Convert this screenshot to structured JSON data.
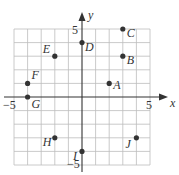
{
  "chart_data": {
    "type": "scatter",
    "title": "",
    "xlabel": "x",
    "ylabel": "y",
    "xlim": [
      -5,
      5
    ],
    "ylim": [
      -5,
      5
    ],
    "grid": true,
    "grid_step": 1,
    "tick_labels": {
      "x": [
        {
          "value": -5,
          "label": "−5"
        },
        {
          "value": 5,
          "label": "5"
        }
      ],
      "y": [
        {
          "value": 5,
          "label": "5"
        },
        {
          "value": -5,
          "label": "−5"
        }
      ]
    },
    "points": [
      {
        "label": "A",
        "x": 2,
        "y": 1,
        "lx": 4,
        "ly": 6
      },
      {
        "label": "B",
        "x": 3,
        "y": 3,
        "lx": 4,
        "ly": 8
      },
      {
        "label": "C",
        "x": 3,
        "y": 5,
        "lx": 4,
        "ly": 8
      },
      {
        "label": "D",
        "x": 0,
        "y": 4,
        "lx": 3,
        "ly": 8
      },
      {
        "label": "E",
        "x": -2,
        "y": 3,
        "lx": -12,
        "ly": -3
      },
      {
        "label": "F",
        "x": -4,
        "y": 1,
        "lx": 4,
        "ly": -4
      },
      {
        "label": "G",
        "x": -4,
        "y": 0,
        "lx": 4,
        "ly": 11
      },
      {
        "label": "H",
        "x": -2,
        "y": -3,
        "lx": -12,
        "ly": 8
      },
      {
        "label": "I",
        "x": 0,
        "y": -4,
        "lx": -9,
        "ly": 9
      },
      {
        "label": "J",
        "x": 4,
        "y": -3,
        "lx": -11,
        "ly": 10
      }
    ],
    "legend": null
  },
  "axes": {
    "x_label": "x",
    "y_label": "y",
    "x_min_label": "−5",
    "x_max_label": "5",
    "y_max_label": "5",
    "y_min_label": "−5"
  }
}
